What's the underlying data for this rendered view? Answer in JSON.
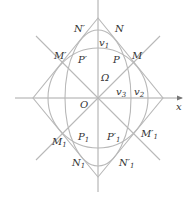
{
  "diagram": {
    "axis_x_label": "x",
    "labels": {
      "N_prime": "N′",
      "N": "N",
      "v1": "v",
      "v1_sub": "1",
      "M_prime": "M′",
      "M": "M",
      "P_prime": "P′",
      "P": "P",
      "Omega": "Ω",
      "v3": "v",
      "v3_sub": "3",
      "v2": "v",
      "v2_sub": "2",
      "O": "O",
      "M1": "M",
      "M1_sub": "1",
      "P1": "P",
      "P1_sub": "1",
      "P1_prime": "P′",
      "P1_prime_sub": "1",
      "M1_prime": "M′",
      "M1_prime_sub": "1",
      "N1": "N",
      "N1_sub": "1",
      "N1_prime": "N′",
      "N1_prime_sub": "1"
    },
    "colors": {
      "lines": "#b8b8b8",
      "text": "#333333"
    }
  }
}
